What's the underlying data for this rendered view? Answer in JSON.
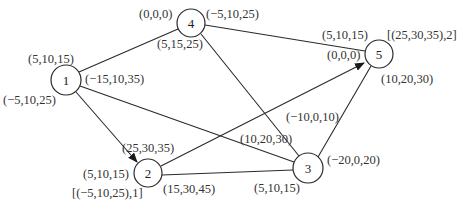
{
  "nodes": [
    {
      "id": "1",
      "label": "1",
      "x": 66,
      "y": 80,
      "r": 15
    },
    {
      "id": "2",
      "label": "2",
      "x": 148,
      "y": 173,
      "r": 14
    },
    {
      "id": "3",
      "label": "3",
      "x": 308,
      "y": 168,
      "r": 15
    },
    {
      "id": "4",
      "label": "4",
      "x": 191,
      "y": 23,
      "r": 14
    },
    {
      "id": "5",
      "label": "5",
      "x": 379,
      "y": 54,
      "r": 14
    }
  ],
  "edges": [
    {
      "from": "1",
      "to": "4",
      "arrow": false
    },
    {
      "from": "1",
      "to": "2",
      "arrow": true
    },
    {
      "from": "1",
      "to": "3",
      "arrow": false
    },
    {
      "from": "4",
      "to": "5",
      "arrow": false
    },
    {
      "from": "4",
      "to": "3",
      "arrow": false
    },
    {
      "from": "2",
      "to": "5",
      "arrow": true
    },
    {
      "from": "2",
      "to": "3",
      "arrow": false
    },
    {
      "from": "3",
      "to": "5",
      "arrow": false
    }
  ],
  "labels": {
    "n1_top": "(5,10,15)",
    "n1_right": "(−15,10,35)",
    "n1_bottom_left": "(−5,10,25)",
    "n4_left": "(0,0,0)",
    "n4_right": "(−5,10,25)",
    "n4_bottom": "(5,15,25)",
    "n5_top": "(5,10,15)",
    "n5_left": "(0,0,0)",
    "n5_right": "[(25,30,35),2]",
    "n5_bottom": "(10,20,30)",
    "n2_top": "(25,30,35)",
    "n2_left": "(5,10,15)",
    "n2_bottom": "[(−5,10,25),1]",
    "n2_right": "(15,30,45)",
    "n3_top": "(−10,0,10)",
    "n3_left": "(10,20,30)",
    "n3_right": "(−20,0,20)",
    "n3_bottom": "(5,10,15)"
  }
}
